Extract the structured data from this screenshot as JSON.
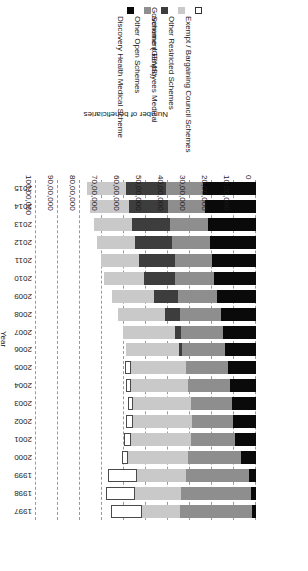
{
  "chart_data": {
    "type": "bar",
    "subtype": "stacked-horizontal",
    "title": "",
    "xlabel": "Number of beneficiaries",
    "ylabel": "Year",
    "xlim": [
      0,
      10000000
    ],
    "xtick_labels": [
      "0",
      "10,00,000",
      "20,00,000",
      "30,00,000",
      "40,00,000",
      "50,00,000",
      "60,00,000",
      "70,00,000",
      "80,00,000",
      "90,00,000",
      "100,00,000"
    ],
    "xtick_values": [
      0,
      1000000,
      2000000,
      3000000,
      4000000,
      5000000,
      6000000,
      7000000,
      8000000,
      9000000,
      10000000
    ],
    "grid": true,
    "grid_style": "dashed-vertical",
    "legend_position": "top-right",
    "rotation_degrees": 180,
    "categories": [
      "1997",
      "1998",
      "1999",
      "2000",
      "2001",
      "2002",
      "2003",
      "2004",
      "2005",
      "2006",
      "2007",
      "2008",
      "2009",
      "2010",
      "2011",
      "2012",
      "2013",
      "2014",
      "2015"
    ],
    "series": [
      {
        "name": "Discovery Health Medical Scheme",
        "color": "#0a0a0a",
        "values": [
          180000,
          230000,
          330000,
          700000,
          950000,
          1030000,
          1080000,
          1180000,
          1250000,
          1400000,
          1500000,
          1600000,
          1750000,
          1900000,
          2000000,
          2100000,
          2200000,
          2300000,
          2400000
        ]
      },
      {
        "name": "Other Open Schemes",
        "color": "#8e8e8e",
        "values": [
          3280000,
          3200000,
          2870000,
          2400000,
          2000000,
          1870000,
          1870000,
          1930000,
          1950000,
          1960000,
          1900000,
          1850000,
          1800000,
          1760000,
          1700000,
          1700000,
          1700000,
          1700000,
          1700000
        ]
      },
      {
        "name": "Government Employees Medical Scheme (GEMS)",
        "color": "#3d3d3d",
        "values": [
          0,
          0,
          0,
          0,
          0,
          0,
          0,
          0,
          0,
          120000,
          280000,
          700000,
          1100000,
          1450000,
          1600000,
          1700000,
          1750000,
          1780000,
          1800000
        ]
      },
      {
        "name": "Other Restricted Schemes",
        "color": "#c9c9c9",
        "values": [
          1720000,
          2050000,
          2200000,
          2700000,
          2750000,
          2700000,
          2620000,
          2550000,
          2500000,
          2450000,
          2350000,
          2130000,
          1900000,
          1800000,
          1750000,
          1730000,
          1730000,
          1750000,
          1770000
        ]
      },
      {
        "name": "Exempt / Bargaining Council Schemes",
        "color": "#ffffff",
        "values": [
          1400000,
          1330000,
          1350000,
          280000,
          280000,
          290000,
          270000,
          260000,
          250000,
          0,
          0,
          0,
          0,
          0,
          0,
          0,
          0,
          0,
          0
        ]
      }
    ]
  },
  "legend": {
    "items": [
      {
        "label": "Exempt / Bargaining Council Schemes",
        "swatch": "#ffffff",
        "outlined": true
      },
      {
        "label": "Other Restricted Schemes",
        "swatch": "#c9c9c9",
        "outlined": false
      },
      {
        "label": "Government Employees Medical Scheme (GEMS)",
        "swatch": "#3d3d3d",
        "outlined": false
      },
      {
        "label": "Other Open Schemes",
        "swatch": "#8e8e8e",
        "outlined": false
      },
      {
        "label": "Discovery Health Medical Scheme",
        "swatch": "#0a0a0a",
        "outlined": false
      }
    ],
    "line2_gems": "Scheme (GEMS)",
    "line1_gems": "Government Employees Medical"
  }
}
